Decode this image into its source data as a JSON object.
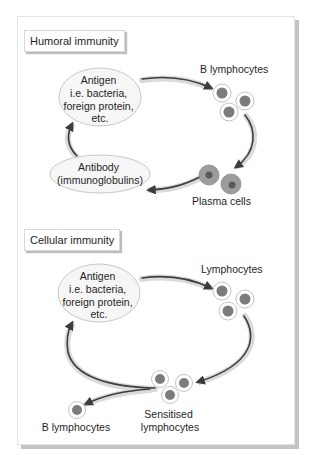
{
  "diagram": {
    "colors": {
      "arrow": "#3d3d3d",
      "arrow_band": "#d4d4d4",
      "cell_outline": "#bdbdbd",
      "cell_nucleus": "#7c7c7c",
      "plasma_cytoplasm": "#9a9a9a",
      "plasma_nucleus": "#5e5e5e",
      "ellipse_fill": "#f6f6f6",
      "ellipse_stroke": "#c8c8c8"
    },
    "humoral": {
      "title": "Humoral immunity",
      "antigen": {
        "lines": [
          "Antigen",
          "i.e. bacteria,",
          "foreign protein,",
          "etc."
        ]
      },
      "b_lymphocytes_label": "B lymphocytes",
      "plasma_cells_label": "Plasma cells",
      "antibody": {
        "lines": [
          "Antibody",
          "(immunoglobulins)"
        ]
      }
    },
    "cellular": {
      "title": "Cellular immunity",
      "antigen": {
        "lines": [
          "Antigen",
          "i.e. bacteria,",
          "foreign protein,",
          "etc."
        ]
      },
      "lymphocytes_label": "Lymphocytes",
      "sensitised_label": [
        "Sensitised",
        "lymphocytes"
      ],
      "b_lymphocytes_label": "B lymphocytes"
    }
  }
}
